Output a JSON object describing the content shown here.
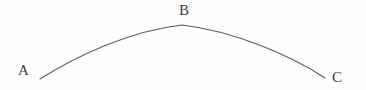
{
  "figure": {
    "type": "geometric-diagram",
    "background_color": "#fefefe",
    "stroke_color": "#5a5a5a",
    "label_color": "#3b3b3b",
    "labels": {
      "left": "A",
      "apex": "B",
      "right": "C"
    },
    "curve": {
      "start": {
        "x": 40,
        "y": 79
      },
      "apex": {
        "x": 182,
        "y": 25
      },
      "end": {
        "x": 325,
        "y": 78
      },
      "stroke_width": 1.1
    }
  }
}
